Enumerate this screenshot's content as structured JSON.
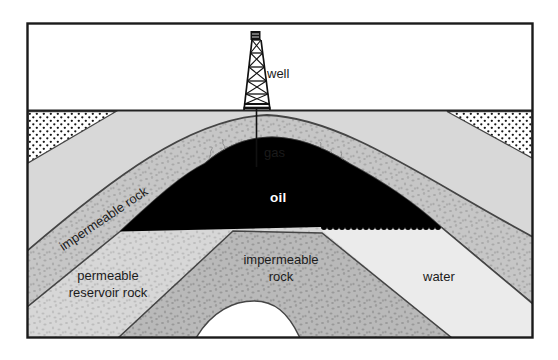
{
  "diagram": {
    "type": "geological cross-section of an anticline petroleum trap",
    "labels": {
      "well": "well",
      "gas": "gas",
      "oil": "oil",
      "caprock": "impermeable rock",
      "reservoir": "permeable reservoir rock",
      "lower_impermeable": "impermeable rock",
      "water": "water"
    },
    "colors": {
      "oil_fill": "#000000",
      "gas_fill": "#ffffff",
      "water_fill": "#ebebeb",
      "surface_band_fill": "#d8d8d8",
      "caprock_band_fill": "#c6c6c6",
      "caprock_speckle": "#a9a9a9",
      "reservoir_band_fill": "#d7d7d7",
      "reservoir_speckle": "#bdbdbd",
      "lower_band_fill": "#b9b9b9",
      "lower_band_speckle": "#999999",
      "stipple_dot": "#161616",
      "outline": "#454545",
      "frame": "#1a1a1a"
    }
  }
}
